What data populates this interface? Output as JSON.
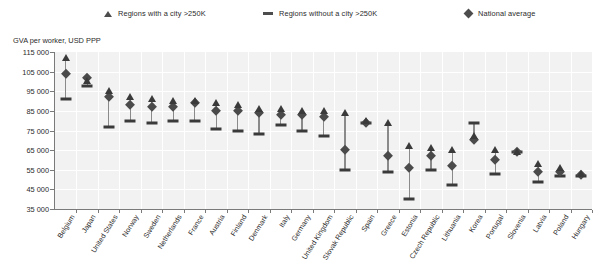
{
  "legend": {
    "items": [
      {
        "label": "Regions with a city >250K",
        "marker": "triangle-up-icon"
      },
      {
        "label": "Regions without a city >250K",
        "marker": "dash-icon"
      },
      {
        "label": "National average",
        "marker": "diamond-icon"
      }
    ]
  },
  "axis_title": "GVA per worker, USD PPP",
  "chart_data": {
    "type": "scatter",
    "title": "GVA per worker, USD PPP",
    "xlabel": "",
    "ylabel": "GVA per worker, USD PPP",
    "ylim": [
      35000,
      115000
    ],
    "ytick_step": 10000,
    "ytick_labels": [
      "115 000",
      "105 000",
      "95 000",
      "85 000",
      "75 000",
      "65 000",
      "55 000",
      "45 000",
      "35 000"
    ],
    "ytick_values": [
      115000,
      105000,
      95000,
      85000,
      75000,
      65000,
      55000,
      45000,
      35000
    ],
    "grid": true,
    "legend_position": "top",
    "categories": [
      "Belgium",
      "Japan",
      "United States",
      "Norway",
      "Sweden",
      "Netherlands",
      "France",
      "Austria",
      "Finland",
      "Denmark",
      "Italy",
      "Germany",
      "United Kingdom",
      "Slovak Republic",
      "Spain",
      "Greece",
      "Estonia",
      "Czech Republic",
      "Lithuania",
      "Korea",
      "Portugal",
      "Slovenia",
      "Latvia",
      "Poland",
      "Hungary"
    ],
    "series": [
      {
        "name": "Regions with a city >250K",
        "marker": "triangle",
        "values": [
          112000,
          100000,
          95000,
          92000,
          91000,
          90000,
          90000,
          89000,
          88000,
          86000,
          86000,
          85000,
          85000,
          84000,
          80000,
          79000,
          67000,
          66000,
          65000,
          72000,
          65000,
          64000,
          58000,
          56000,
          53000
        ]
      },
      {
        "name": "Regions without a city >250K",
        "marker": "dash",
        "values": [
          91000,
          97500,
          77000,
          80000,
          79000,
          80000,
          80000,
          76000,
          75000,
          73000,
          78000,
          75000,
          72000,
          55000,
          79000,
          54000,
          40000,
          55000,
          47000,
          79000,
          53000,
          64000,
          49000,
          52000,
          52000
        ]
      },
      {
        "name": "National average",
        "marker": "diamond",
        "values": [
          104000,
          102000,
          92000,
          88000,
          87000,
          87000,
          89000,
          85000,
          85000,
          84000,
          83000,
          83000,
          82000,
          65000,
          79000,
          62000,
          56000,
          62000,
          57000,
          70000,
          60000,
          64000,
          54000,
          54000,
          52500
        ]
      }
    ]
  }
}
